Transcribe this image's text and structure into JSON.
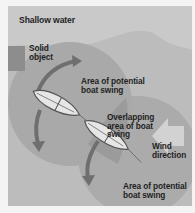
{
  "diagram": {
    "title": "Shallow water",
    "labels": {
      "solid_object": [
        "Solid",
        "object"
      ],
      "area_top": [
        "Area of potential",
        "boat swing"
      ],
      "overlap": [
        "Overlapping",
        "area of boat",
        "swing"
      ],
      "wind": [
        "Wind",
        "direction"
      ],
      "area_bottom": [
        "Area of potential",
        "boat swing"
      ]
    },
    "colors": {
      "background": "#f4f4f4",
      "shallow_water": "#c9c9c9",
      "deep_water": "#b4b4b4",
      "swing_area": "#a3a3a3",
      "overlap_area": "#979797",
      "solid_object": "#8d8d8d",
      "arrow": "#6f6f6f",
      "boat_hull": "#e6e6e6"
    },
    "icons": [
      "boat-icon",
      "boat-icon",
      "curved-arrow-icon",
      "curved-arrow-icon",
      "wind-arrow-icon"
    ]
  }
}
